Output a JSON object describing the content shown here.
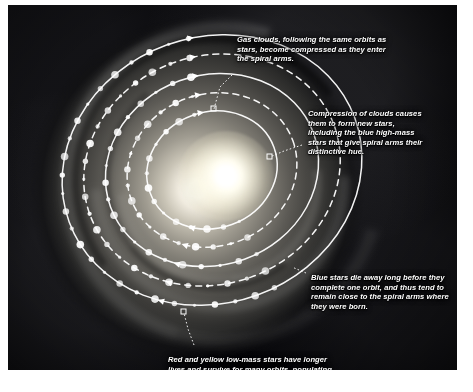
{
  "figure": {
    "background_image": "grayscale spiral galaxy photograph"
  },
  "captions": {
    "gas_clouds": "Gas clouds, following the same orbits as stars, become compressed as they enter the spiral arms.",
    "compression": "Compression of clouds causes them to form new stars, including the blue high-mass stars that give spiral arms their distinctive hue.",
    "blue_stars": "Blue stars die away long before they complete one orbit, and thus tend to remain close to the spiral arms where they were born.",
    "red_yellow_stars": "Red and yellow low-mass stars have longer lives and survive for many orbits, populating the entire disk."
  },
  "edge_fragments": [
    "",
    "",
    "",
    "",
    "",
    "",
    ""
  ],
  "chart_data": {
    "type": "diagram",
    "galaxy_center": {
      "x": 212,
      "y": 170
    },
    "orbits": [
      {
        "name": "orbit-1-innermost",
        "rx": 66,
        "ry": 58,
        "rotation": -20,
        "style": "solid",
        "stars": 14,
        "arrowheads": 2
      },
      {
        "name": "orbit-2",
        "rx": 86,
        "ry": 76,
        "rotation": -20,
        "style": "dashed",
        "stars": 17,
        "arrowheads": 2
      },
      {
        "name": "orbit-3",
        "rx": 108,
        "ry": 95,
        "rotation": -20,
        "style": "solid",
        "stars": 20,
        "arrowheads": 2
      },
      {
        "name": "orbit-4",
        "rx": 130,
        "ry": 114,
        "rotation": -20,
        "style": "dashed",
        "stars": 23,
        "arrowheads": 2
      },
      {
        "name": "orbit-5-outermost",
        "rx": 152,
        "ry": 133,
        "rotation": -20,
        "style": "solid",
        "stars": 26,
        "arrowheads": 2
      }
    ],
    "orbit_direction": "counter-clockwise",
    "star_marker_color": "#ffffff",
    "orbit_line_color": "#ffffff",
    "leader_line_style": "dotted",
    "legend": [],
    "annotations": [
      "Gas clouds, following the same orbits as stars, become compressed as they enter the spiral arms.",
      "Compression of clouds causes them to form new stars, including the blue high-mass stars that give spiral arms their distinctive hue.",
      "Blue stars die away long before they complete one orbit, and thus tend to remain close to the spiral arms where they were born.",
      "Red and yellow low-mass stars have longer lives and survive for many orbits, populating the entire disk."
    ]
  }
}
